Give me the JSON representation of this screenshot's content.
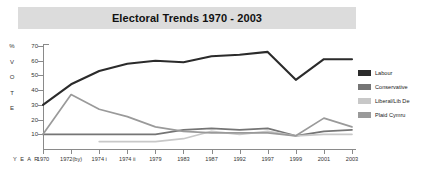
{
  "title": "Electoral Trends 1970 - 2003",
  "axes": {
    "year_word": "Y E A R",
    "vertical_word_letters": [
      "%",
      "V",
      "O",
      "T",
      "E"
    ],
    "y_ticks": [
      70,
      60,
      50,
      40,
      30,
      20,
      10
    ]
  },
  "legend": {
    "items": [
      {
        "label": "Labour",
        "color": "#2b2b2b"
      },
      {
        "label": "Conservative",
        "color": "#757575"
      },
      {
        "label": "Liberal/Lib De",
        "color": "#c8c8c8"
      },
      {
        "label": "Plaid Cymru",
        "color": "#9a9a9a"
      }
    ]
  },
  "chart_data": {
    "type": "line",
    "title": "Electoral Trends 1970 - 2003",
    "xlabel": "Y E A R",
    "ylabel": "% VOTE",
    "ylim": [
      0,
      70
    ],
    "grid": false,
    "legend_position": "right",
    "categories": [
      "1970",
      "1972(by)",
      "1974 i",
      "1974 ii",
      "1979",
      "1983",
      "1987",
      "1992",
      "1997",
      "1999",
      "2001",
      "2003"
    ],
    "series": [
      {
        "name": "Labour",
        "color": "#2b2b2b",
        "values": [
          30,
          44,
          53,
          58,
          60,
          59,
          63,
          64,
          66,
          47,
          61,
          61
        ]
      },
      {
        "name": "Conservative",
        "color": "#757575",
        "values": [
          10,
          10,
          10,
          10,
          10,
          13,
          14,
          13,
          14,
          9,
          12,
          13
        ]
      },
      {
        "name": "Liberal/Lib De",
        "color": "#c8c8c8",
        "values": [
          null,
          null,
          5,
          5,
          5,
          7,
          12,
          10,
          12,
          9,
          10,
          10
        ]
      },
      {
        "name": "Plaid Cymru",
        "color": "#9a9a9a",
        "values": [
          10,
          37,
          27,
          22,
          15,
          12,
          11,
          11,
          11,
          9,
          21,
          15
        ]
      }
    ]
  }
}
